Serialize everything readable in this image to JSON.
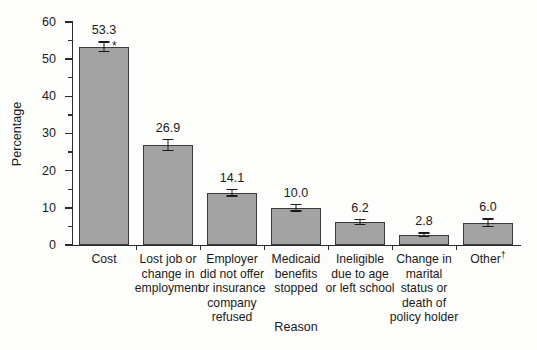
{
  "chart_data": {
    "type": "bar",
    "title": "",
    "xlabel": "Reason",
    "ylabel": "Percentage",
    "ylim": [
      0,
      60
    ],
    "ytick_step": 10,
    "yminor_step": 5,
    "grid": false,
    "legend": null,
    "categories": [
      "Cost",
      "Lost job or change in employment",
      "Employer did not offer or insurance company refused",
      "Medicaid benefits stopped",
      "Ineligible due to age or left school",
      "Change in marital status or death of policy holder",
      "Other†"
    ],
    "category_lines": [
      [
        "Cost"
      ],
      [
        "Lost job or",
        "change in",
        "employment"
      ],
      [
        "Employer",
        "did not offer",
        "or insurance",
        "company",
        "refused"
      ],
      [
        "Medicaid",
        "benefits",
        "stopped"
      ],
      [
        "Ineligible",
        "due to age",
        "or left school"
      ],
      [
        "Change in",
        "marital",
        "status or",
        "death of",
        "policy holder"
      ],
      [
        "Other†"
      ]
    ],
    "values": [
      53.3,
      26.9,
      14.1,
      10.0,
      6.2,
      2.8,
      6.0
    ],
    "value_labels": [
      "53.3",
      "26.9",
      "14.1",
      "10.0",
      "6.2",
      "2.8",
      "6.0"
    ],
    "errors": [
      1.5,
      1.7,
      1.1,
      1.0,
      0.8,
      0.6,
      1.2
    ],
    "annotations": [
      {
        "category_index": 0,
        "marker": "*"
      }
    ],
    "ytick_labels": [
      "0",
      "10",
      "20",
      "30",
      "40",
      "50",
      "60"
    ],
    "ytick_values": [
      0,
      10,
      20,
      30,
      40,
      50,
      60
    ],
    "yminor_values": [
      5,
      15,
      25,
      35,
      45,
      55
    ],
    "bar_color": "#a3a3a3",
    "bar_edge_color": "#3a3a3a",
    "axis_color": "#2b2b2b",
    "text_color": "#1b1b1b",
    "background_color": "#fdfdfc"
  }
}
